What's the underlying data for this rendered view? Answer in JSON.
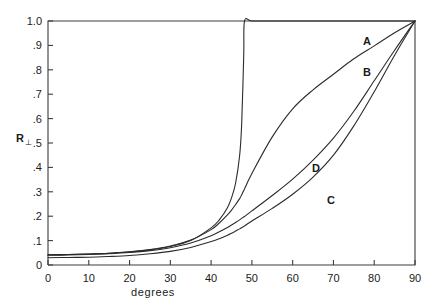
{
  "figure": {
    "background_color": "#ffffff",
    "line_color": "#2b2b2b",
    "axis_color": "#3c3c3c"
  },
  "axes": {
    "y_label_main": "R",
    "y_label_sub": "⊥",
    "x_label": "degrees",
    "y_ticks": [
      "0",
      ".1",
      ".2",
      ".3",
      ".4",
      ".5",
      ".6",
      ".7",
      ".8",
      ".9",
      "1.0"
    ],
    "x_ticks": [
      "0",
      "10",
      "20",
      "30",
      "40",
      "50",
      "60",
      "70",
      "80",
      "90"
    ]
  },
  "curve_labels": [
    {
      "id": "curve-label-a",
      "text": "A",
      "x": 367,
      "y": 45
    },
    {
      "id": "curve-label-b",
      "text": "B",
      "x": 367,
      "y": 76
    },
    {
      "id": "curve-label-d",
      "text": "D",
      "x": 316,
      "y": 172
    },
    {
      "id": "curve-label-c",
      "text": "C",
      "x": 331,
      "y": 204
    }
  ],
  "chart_data": {
    "type": "line",
    "title": "",
    "xlabel": "degrees",
    "ylabel": "R⊥",
    "xlim": [
      0,
      90
    ],
    "ylim": [
      0,
      1.0
    ],
    "xticks": [
      0,
      10,
      20,
      30,
      40,
      50,
      60,
      70,
      80,
      90
    ],
    "yticks": [
      0,
      0.1,
      0.2,
      0.3,
      0.4,
      0.5,
      0.6,
      0.7,
      0.8,
      0.9,
      1.0
    ],
    "grid": false,
    "legend": "inline-labels",
    "annotations": [
      "A",
      "B",
      "C",
      "D"
    ],
    "x": [
      0,
      5,
      10,
      15,
      20,
      25,
      30,
      35,
      40,
      42,
      44,
      45,
      46,
      47,
      47.5,
      48,
      48.2,
      50,
      55,
      60,
      65,
      70,
      75,
      80,
      85,
      90
    ],
    "series": [
      {
        "name": "A",
        "description": "total internal reflection: rises abruptly to unity at the critical angle near 48 degrees and stays at 1.0",
        "values": [
          0.042,
          0.043,
          0.045,
          0.048,
          0.053,
          0.062,
          0.076,
          0.1,
          0.152,
          0.185,
          0.235,
          0.275,
          0.335,
          0.45,
          0.58,
          0.86,
          1.0,
          1.0,
          1.0,
          1.0,
          1.0,
          1.0,
          1.0,
          1.0,
          1.0,
          1.0
        ]
      },
      {
        "name": "B",
        "description": "steep rise past 45 degrees, strongly convex, approaching unity at grazing incidence",
        "values": [
          0.042,
          0.043,
          0.045,
          0.048,
          0.054,
          0.063,
          0.078,
          0.102,
          0.145,
          0.172,
          0.205,
          0.225,
          0.248,
          0.272,
          0.288,
          0.305,
          0.312,
          0.375,
          0.525,
          0.64,
          0.718,
          0.782,
          0.845,
          0.898,
          0.952,
          1.0
        ]
      },
      {
        "name": "D",
        "description": "moderate monotonic rise, intermediate between B and C",
        "values": [
          0.04,
          0.041,
          0.043,
          0.046,
          0.051,
          0.059,
          0.071,
          0.09,
          0.12,
          0.136,
          0.154,
          0.164,
          0.174,
          0.185,
          0.191,
          0.197,
          0.199,
          0.222,
          0.285,
          0.352,
          0.43,
          0.52,
          0.63,
          0.755,
          0.88,
          1.0
        ]
      },
      {
        "name": "C",
        "description": "shallowest curve, stays lowest until grazing incidence then sweeps up to unity",
        "values": [
          0.03,
          0.031,
          0.032,
          0.035,
          0.039,
          0.046,
          0.056,
          0.072,
          0.096,
          0.108,
          0.122,
          0.13,
          0.139,
          0.148,
          0.153,
          0.158,
          0.16,
          0.18,
          0.232,
          0.29,
          0.36,
          0.45,
          0.57,
          0.71,
          0.86,
          1.0
        ]
      }
    ]
  },
  "geometry": {
    "plot_left": 48,
    "plot_right": 415,
    "plot_top": 21,
    "plot_bottom": 265,
    "y_axis_value_top": 1.0,
    "y_axis_value_bottom": 0.0,
    "tick_len": 5
  }
}
